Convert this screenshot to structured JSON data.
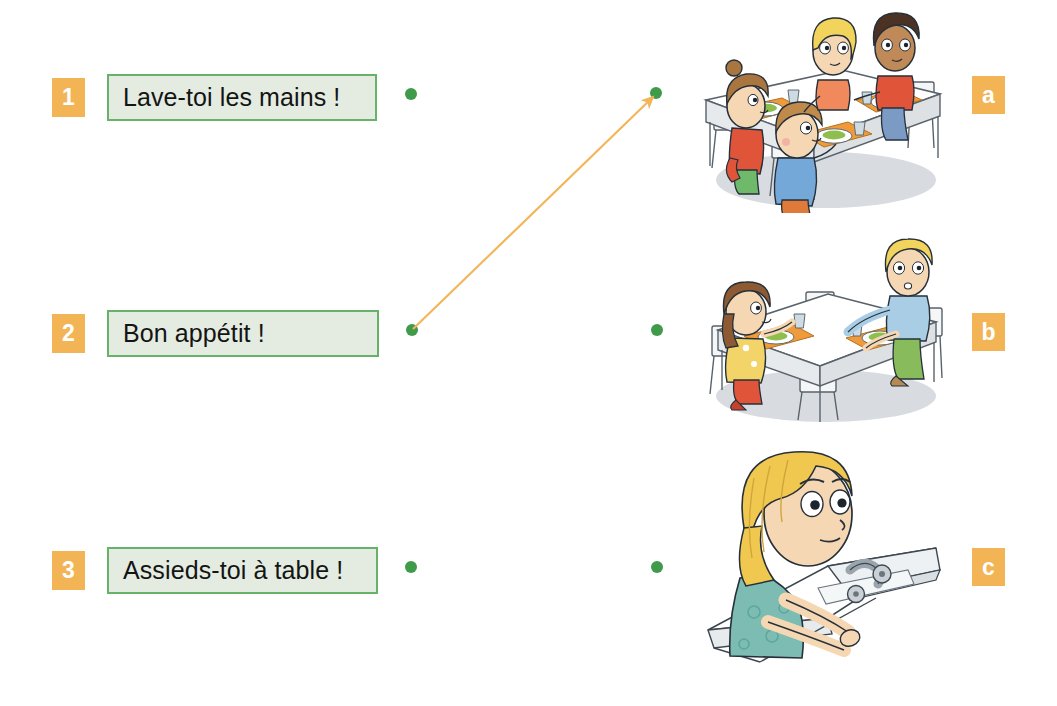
{
  "exercise": {
    "type": "matching-exercise",
    "language": "fr",
    "left_items": [
      {
        "number": "1",
        "text": "Lave-toi les mains !",
        "box_width": 270
      },
      {
        "number": "2",
        "text": "Bon appétit !",
        "box_width": 272
      },
      {
        "number": "3",
        "text": "Assieds-toi à table !",
        "box_width": 271
      }
    ],
    "right_items": [
      {
        "letter": "a",
        "description": "Four children eating lunch at a cafeteria table with trays, plates of salad and cups"
      },
      {
        "letter": "b",
        "description": "Two children seated opposite each other at a table with orange placemats, plates and cups"
      },
      {
        "letter": "c",
        "description": "A blonde girl washing her hands at a sink with a tap"
      }
    ],
    "connections": [
      {
        "from": "2",
        "to": "a",
        "style": "arrow"
      }
    ]
  },
  "colors": {
    "badge_orange": "#f2b455",
    "badge_text": "#ffffff",
    "box_border_green": "#68b168",
    "box_fill_green": "#e4ece1",
    "dot_green": "#3f9b4a",
    "arrow_orange": "#f3b557",
    "text_black": "#141414",
    "page_background": "#ffffff"
  }
}
